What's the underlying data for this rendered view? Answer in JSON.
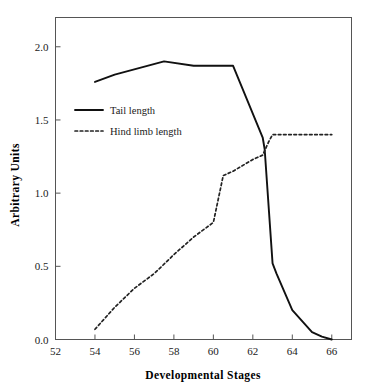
{
  "chart_data": {
    "type": "line",
    "title": "",
    "subtitle": "",
    "xlabel": "Developmental  Stages",
    "ylabel": "Arbitrary  Units",
    "xlim": [
      52,
      67
    ],
    "ylim": [
      0.0,
      2.2
    ],
    "xticks": [
      52,
      54,
      56,
      58,
      60,
      62,
      64,
      66
    ],
    "xtick_labels": [
      "52",
      "54",
      "56",
      "58",
      "60",
      "62",
      "64",
      "66"
    ],
    "yticks": [
      0.0,
      0.5,
      1.0,
      1.5,
      2.0
    ],
    "ytick_labels": [
      "0.0",
      "0.5",
      "1.0",
      "1.5",
      "2.0"
    ],
    "grid": false,
    "legend_position": "upper-left-inside",
    "series": [
      {
        "name": "Tail length",
        "style": "solid",
        "color": "#111111",
        "x": [
          54,
          55,
          57.5,
          59,
          61,
          62.5,
          62.6,
          63,
          63.2,
          64,
          65,
          65.5,
          66
        ],
        "values": [
          1.76,
          1.81,
          1.9,
          1.87,
          1.87,
          1.38,
          1.3,
          0.52,
          0.45,
          0.2,
          0.05,
          0.02,
          0.0
        ]
      },
      {
        "name": "Hind limb length",
        "style": "dotted",
        "color": "#222222",
        "x": [
          54,
          55,
          56,
          57,
          58,
          59,
          60,
          60.5,
          61,
          62,
          62.5,
          62.8,
          63,
          64,
          65,
          66
        ],
        "values": [
          0.07,
          0.22,
          0.35,
          0.45,
          0.58,
          0.7,
          0.8,
          1.12,
          1.15,
          1.23,
          1.26,
          1.35,
          1.4,
          1.4,
          1.4,
          1.4
        ]
      }
    ],
    "legend_entries": [
      {
        "label": "Tail length",
        "style": "solid"
      },
      {
        "label": "Hind limb length",
        "style": "dotted"
      }
    ]
  }
}
